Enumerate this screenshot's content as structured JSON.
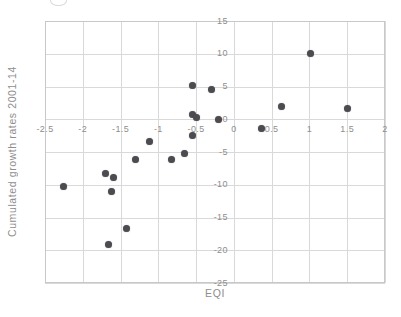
{
  "figure": {
    "background": "#ffffff"
  },
  "chart_data": {
    "type": "scatter",
    "title": "",
    "xlabel": "EQI",
    "ylabel": "Cumulated growth rates 2001-14",
    "xlim": [
      -2.5,
      2
    ],
    "ylim": [
      -25,
      15
    ],
    "x_ticks": [
      -2.5,
      -2,
      -1.5,
      -1,
      -0.5,
      0,
      0.5,
      1,
      1.5,
      2
    ],
    "x_tick_labels": [
      "-2.5",
      "-2",
      "-1.5",
      "-1",
      "-0.5",
      "0",
      "0.5",
      "1",
      "1.5",
      "2"
    ],
    "y_ticks": [
      15,
      10,
      5,
      0,
      -5,
      -10,
      -15,
      -20,
      -25
    ],
    "y_tick_labels": [
      "15",
      "10",
      "5",
      "0",
      "-5",
      "-10",
      "-15",
      "-20",
      "-25"
    ],
    "grid": true,
    "legend": false,
    "axes_cross_at_origin": true,
    "points": [
      [
        -2.25,
        -10.3
      ],
      [
        -1.7,
        -8.3
      ],
      [
        -1.6,
        -8.9
      ],
      [
        -1.62,
        -11.0
      ],
      [
        -1.66,
        -19.1
      ],
      [
        -1.42,
        -16.7
      ],
      [
        -1.3,
        -6.1
      ],
      [
        -1.12,
        -3.4
      ],
      [
        -0.82,
        -6.1
      ],
      [
        -0.65,
        -5.2
      ],
      [
        -0.55,
        5.2
      ],
      [
        -0.3,
        4.6
      ],
      [
        -0.55,
        0.8
      ],
      [
        -0.5,
        0.2
      ],
      [
        -0.55,
        -2.5
      ],
      [
        -0.21,
        0.0
      ],
      [
        0.36,
        -1.4
      ],
      [
        0.63,
        1.9
      ],
      [
        1.02,
        10.1
      ],
      [
        1.5,
        1.7
      ]
    ],
    "point_color": "#4c4c50",
    "grid_color": "#d9d9d9",
    "border_color": "#c8c8c8",
    "label_color": "#8e8e8e"
  }
}
